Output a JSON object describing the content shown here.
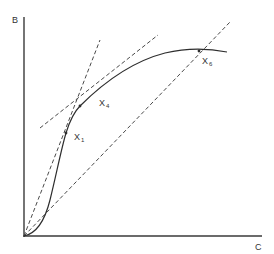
{
  "diagram": {
    "axes": {
      "y_label": "B",
      "x_label": "C"
    },
    "points": [
      {
        "name": "X",
        "subscript": "1"
      },
      {
        "name": "X",
        "subscript": "4"
      },
      {
        "name": "X",
        "subscript": "6"
      }
    ],
    "colors": {
      "line": "#2e2e2e",
      "background": "#ffffff"
    }
  }
}
